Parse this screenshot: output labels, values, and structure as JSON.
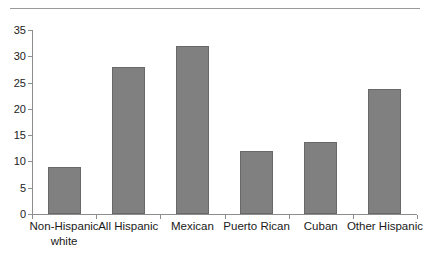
{
  "chart_data": {
    "type": "bar",
    "title": "",
    "subtitle": "",
    "xlabel": "",
    "ylabel": "",
    "categories": [
      "Non-Hispanic\nwhite",
      "All Hispanic",
      "Mexican",
      "Puerto Rican",
      "Cuban",
      "Other Hispanic"
    ],
    "values": [
      9.0,
      28.0,
      32.0,
      12.0,
      13.7,
      23.8
    ],
    "ylim": [
      0,
      35
    ],
    "yticks": [
      0,
      5,
      10,
      15,
      20,
      25,
      30,
      35
    ],
    "ytick_labels": [
      "0",
      "5",
      "10",
      "15",
      "20",
      "25",
      "30",
      "35"
    ],
    "grid": false,
    "legend": null,
    "bar_color": "#808080",
    "bar_edge_color": "#686868",
    "axis_color": "#8d8d8d",
    "background": "#ffffff"
  },
  "decor": {
    "top_rule_color": "#9a9a9a"
  }
}
